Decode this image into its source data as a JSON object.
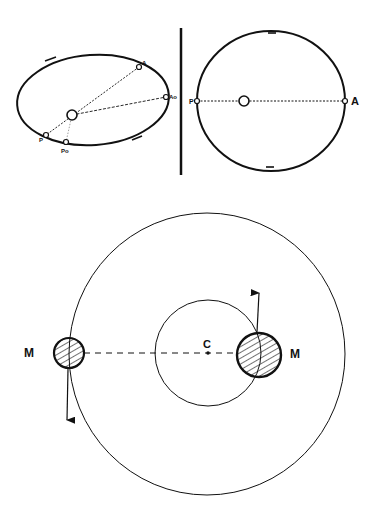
{
  "top_left_orbit": {
    "labels": {
      "A": "A",
      "Ao": "Ao",
      "P": "P",
      "Po": "Po"
    },
    "description": "Elliptical orbit with focus body, apsides A and P, and Ao/Po points"
  },
  "top_right_orbit": {
    "labels": {
      "P": "P",
      "A": "A"
    },
    "description": "Near-circular orbit with line of apsides P–A through central body"
  },
  "bottom_diagram": {
    "labels": {
      "center": "C",
      "mass_left": "M",
      "mass_right": "M"
    },
    "description": "Two masses orbiting common center of mass C on concentric circles"
  },
  "colors": {
    "ink": "#111111",
    "background": "#ffffff"
  }
}
